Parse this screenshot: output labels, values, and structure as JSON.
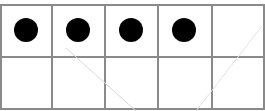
{
  "ten_frame": {
    "rows": 2,
    "columns": 5,
    "filled_count": 4,
    "total_cells": 10,
    "cells": [
      {
        "row": 0,
        "col": 0,
        "filled": true
      },
      {
        "row": 0,
        "col": 1,
        "filled": true
      },
      {
        "row": 0,
        "col": 2,
        "filled": true
      },
      {
        "row": 0,
        "col": 3,
        "filled": true
      },
      {
        "row": 0,
        "col": 4,
        "filled": false
      },
      {
        "row": 1,
        "col": 0,
        "filled": false
      },
      {
        "row": 1,
        "col": 1,
        "filled": false
      },
      {
        "row": 1,
        "col": 2,
        "filled": false
      },
      {
        "row": 1,
        "col": 3,
        "filled": false
      },
      {
        "row": 1,
        "col": 4,
        "filled": false
      }
    ],
    "colors": {
      "counter": "#000000",
      "grid_line": "#8a8a8a",
      "background": "#ffffff"
    }
  }
}
